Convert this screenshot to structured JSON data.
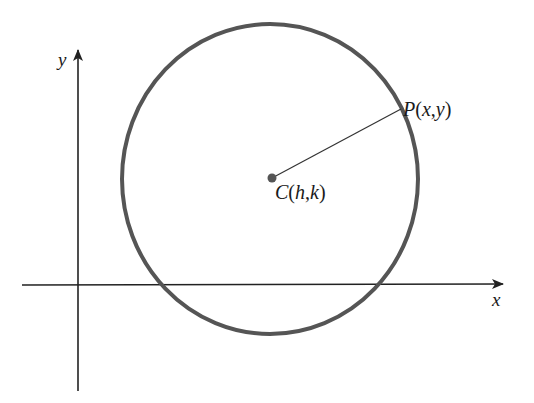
{
  "diagram": {
    "axes": {
      "x_label": "x",
      "y_label": "y",
      "color": "#222222"
    },
    "circle": {
      "cx": 270,
      "cy": 179,
      "rx": 148,
      "ry": 155,
      "stroke_color": "#555555",
      "stroke_width": 4
    },
    "center_point": {
      "label_prefix": "C",
      "label_open": "(",
      "label_h": "h",
      "label_sep": ",",
      "label_k": "k",
      "label_close": ")",
      "full_label": "C(h,k)",
      "color": "#555555"
    },
    "circle_point": {
      "label_prefix": "P",
      "label_open": "(",
      "label_x": "x",
      "label_sep": ",",
      "label_y": "y",
      "label_close": ")",
      "full_label": "P(x,y)"
    },
    "radius_segment": {
      "from": "C",
      "to": "P",
      "color": "#333333"
    }
  }
}
